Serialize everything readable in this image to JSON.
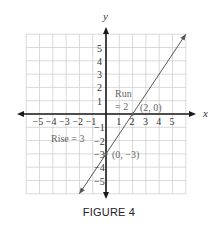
{
  "caption": "FIGURE 4",
  "chart_data": {
    "type": "line",
    "title": "",
    "xlabel": "x",
    "ylabel": "y",
    "xlim": [
      -6,
      6
    ],
    "ylim": [
      -6,
      6
    ],
    "grid": true,
    "x_ticks": [
      -5,
      -4,
      -3,
      -2,
      -1,
      1,
      2,
      3,
      4,
      5
    ],
    "y_ticks": [
      5,
      4,
      3,
      2,
      1,
      -1,
      -2,
      -3,
      -4,
      -5
    ],
    "x_tick_labels": [
      "−5",
      "−4",
      "−3",
      "−2",
      "−1",
      "1",
      "2",
      "3",
      "4",
      "5"
    ],
    "y_tick_labels": [
      "5",
      "4",
      "3",
      "2",
      "1",
      "−1",
      "−2",
      "−3",
      "−4",
      "−5"
    ],
    "series": [
      {
        "name": "line",
        "equation": "y = 3/2 x − 3",
        "slope": 1.5,
        "intercept": -3,
        "x": [
          -2,
          6
        ],
        "y": [
          -6,
          6
        ]
      }
    ],
    "points": [
      {
        "x": 2,
        "y": 0,
        "label": "(2, 0)"
      },
      {
        "x": 0,
        "y": -3,
        "label": "(0, −3)"
      }
    ],
    "annotations": [
      {
        "text": "Run",
        "line2": "= 2"
      },
      {
        "text": "Rise = 3"
      }
    ]
  },
  "labels": {
    "x_axis": "x",
    "y_axis": "y",
    "run_line1": "Run",
    "run_line2": "= 2",
    "rise": "Rise = 3",
    "point_x_intercept": "(2, 0)",
    "point_y_intercept": "(0, −3)"
  },
  "colors": {
    "grid": "#cfcfcf",
    "axis": "#1a1a1a",
    "line": "#555555",
    "text": "#333333",
    "annotation": "#666666"
  }
}
